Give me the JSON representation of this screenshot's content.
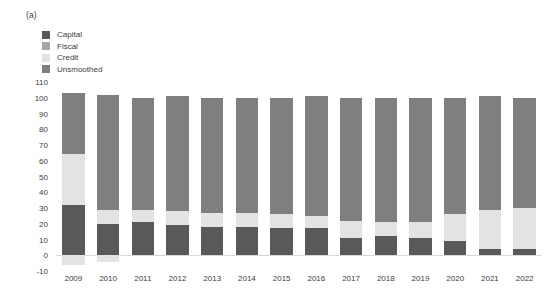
{
  "panel": {
    "label": "(a)"
  },
  "legend": {
    "position": "top-left",
    "items": [
      {
        "label": "Capital",
        "color": "#595959"
      },
      {
        "label": "Fiscal",
        "color": "#a6a6a6"
      },
      {
        "label": "Credit",
        "color": "#e3e3e3"
      },
      {
        "label": "Unsmoothed",
        "color": "#7f7f7f"
      }
    ]
  },
  "chart_data": {
    "type": "bar",
    "stacked": true,
    "title": "",
    "subtitle": "",
    "xlabel": "",
    "ylabel": "",
    "grid": false,
    "ylim": [
      -10,
      110
    ],
    "ytick_step": 10,
    "yticks": [
      110,
      100,
      90,
      80,
      70,
      60,
      50,
      40,
      30,
      20,
      10,
      0,
      -10
    ],
    "ytick_labels": [
      "110",
      "100",
      "90",
      "80",
      "70",
      "60",
      "50",
      "40",
      "30",
      "20",
      "10",
      "0",
      "-10"
    ],
    "categories": [
      "2009",
      "2010",
      "2011",
      "2012",
      "2013",
      "2014",
      "2015",
      "2016",
      "2017",
      "2018",
      "2019",
      "2020",
      "2021",
      "2022"
    ],
    "series": [
      {
        "name": "Capital",
        "color": "#595959",
        "values": [
          32,
          20,
          21,
          19,
          18,
          18,
          17,
          17,
          11,
          12,
          11,
          9,
          4,
          4
        ]
      },
      {
        "name": "Fiscal",
        "color": "#a6a6a6",
        "values": [
          0,
          0,
          0,
          0,
          0,
          0,
          0,
          0,
          0,
          0,
          0,
          0,
          0,
          0
        ]
      },
      {
        "name": "Credit",
        "color": "#e3e3e3",
        "values": [
          32,
          9,
          8,
          9,
          9,
          9,
          9,
          8,
          11,
          9,
          10,
          17,
          25,
          26
        ]
      },
      {
        "name": "Unsmoothed",
        "color": "#7f7f7f",
        "values": [
          39,
          73,
          71,
          73,
          73,
          73,
          74,
          76,
          78,
          79,
          79,
          74,
          72,
          70
        ]
      }
    ],
    "negative_series": [
      {
        "name": "Credit",
        "color": "#e3e3e3",
        "values": [
          -6,
          -4,
          0,
          0,
          0,
          0,
          0,
          0,
          0,
          0,
          0,
          0,
          0,
          0
        ]
      }
    ],
    "totals": [
      103,
      102,
      100,
      101,
      100,
      100,
      100,
      101,
      100,
      100,
      100,
      100,
      101,
      100
    ]
  },
  "style": {
    "bar_color_capital": "#595959",
    "bar_color_fiscal": "#a6a6a6",
    "bar_color_credit": "#e3e3e3",
    "bar_color_unsmoothed": "#7f7f7f",
    "axis_text_color": "#3d3d3d",
    "background": "#ffffff"
  }
}
